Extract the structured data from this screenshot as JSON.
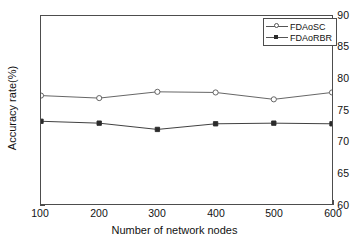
{
  "chart_data": {
    "type": "line",
    "title": "",
    "xlabel": "Number of network nodes",
    "ylabel": "Accuracy rate(%)",
    "x": [
      100,
      200,
      300,
      400,
      500,
      600
    ],
    "xtick_labels": [
      "100",
      "200",
      "300",
      "400",
      "500",
      "600"
    ],
    "ytick_labels": [
      "60",
      "65",
      "70",
      "75",
      "80",
      "85",
      "90"
    ],
    "xlim": [
      100,
      600
    ],
    "ylim": [
      60,
      90
    ],
    "grid": false,
    "legend_position": "top-right",
    "series": [
      {
        "name": "FDAoSC",
        "marker": "circle-open",
        "color": "#555555",
        "values": [
          77.3,
          76.9,
          77.9,
          77.8,
          76.7,
          77.8
        ]
      },
      {
        "name": "FDAoRBR",
        "marker": "square-filled",
        "color": "#2b2b2b",
        "values": [
          73.2,
          72.9,
          71.9,
          72.8,
          72.9,
          72.8
        ]
      }
    ]
  }
}
